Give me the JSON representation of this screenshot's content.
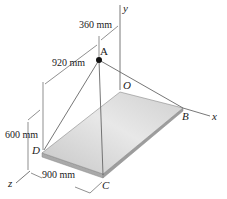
{
  "figure": {
    "points": {
      "A": "A",
      "B": "B",
      "C": "C",
      "D": "D",
      "O": "O"
    },
    "axes": {
      "x": "x",
      "y": "y",
      "z": "z"
    },
    "dimensions": {
      "offset_A_from_y_axis": "360 mm",
      "offset_A_from_D_edge": "920 mm",
      "height_of_A": "600 mm",
      "plate_width": "900 mm"
    },
    "colors": {
      "line": "#555555",
      "plate_light": "#e6e6e6",
      "plate_dark": "#b8b8b8",
      "plate_edge": "#8a8a8a",
      "point_A": "#111111"
    }
  }
}
